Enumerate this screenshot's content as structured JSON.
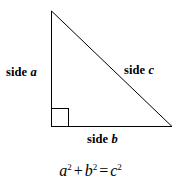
{
  "figure": {
    "background_color": "#ffffff",
    "stroke_color": "#000000"
  },
  "triangle": {
    "vertices": {
      "apex": {
        "x": 51,
        "y": 11
      },
      "bottom_left": {
        "x": 51,
        "y": 126
      },
      "bottom_right": {
        "x": 172,
        "y": 126
      }
    },
    "right_angle_marker": {
      "x": 51,
      "y": 108,
      "size": 18,
      "at_vertex": "bottom_left"
    }
  },
  "labels": {
    "side_a": {
      "text": "side ",
      "variable": "a"
    },
    "side_b": {
      "text": "side ",
      "variable": "b"
    },
    "side_c": {
      "text": "side ",
      "variable": "c"
    }
  },
  "equation": {
    "a": "a",
    "a_exp": "2",
    "plus": "+",
    "b": "b",
    "b_exp": "2",
    "equals": "=",
    "c": "c",
    "c_exp": "2",
    "plain": "a2 + b2 = c2"
  }
}
